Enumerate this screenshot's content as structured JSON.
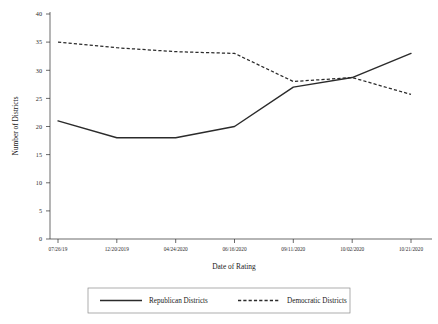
{
  "chart_data": {
    "type": "line",
    "title": "",
    "xlabel": "Date of Rating",
    "ylabel": "Number of Districts",
    "categories": [
      "07/26/19",
      "12/20/2019",
      "04/24/2020",
      "06/16/2020",
      "09/11/2020",
      "10/02/2020",
      "10/21/2020"
    ],
    "yticks": [
      "0",
      "5",
      "10",
      "15",
      "20",
      "25",
      "30",
      "35",
      "40"
    ],
    "ylim": [
      0,
      40
    ],
    "grid": false,
    "legend_position": "bottom",
    "series": [
      {
        "name": "Republican Districts",
        "style": "solid",
        "color": "#2b2b2b",
        "values": [
          21,
          18,
          18,
          20,
          27,
          28.7,
          33
        ]
      },
      {
        "name": "Democratic Districts",
        "style": "dashed",
        "color": "#2b2b2b",
        "values": [
          35,
          34,
          33.3,
          33,
          28,
          28.7,
          25.7
        ]
      }
    ]
  },
  "axes": {
    "y_title": "Number of Districts",
    "x_title": "Date of Rating",
    "y_tick_labels": [
      "40",
      "35",
      "30",
      "25",
      "20",
      "15",
      "10",
      "5",
      "0"
    ],
    "x_tick_labels": [
      "07/26/19",
      "12/20/2019",
      "04/24/2020",
      "06/16/2020",
      "09/11/2020",
      "10/02/2020",
      "10/21/2020"
    ]
  },
  "legend": {
    "items": [
      {
        "label": "Republican Districts",
        "swatch": "solid-line-swatch"
      },
      {
        "label": "Democratic Districts",
        "swatch": "dashed-line-swatch"
      }
    ]
  }
}
